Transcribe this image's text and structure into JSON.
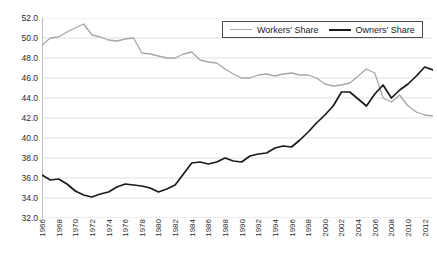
{
  "chart_data": {
    "type": "line",
    "title": "",
    "subtitle": "",
    "xlabel": "",
    "ylabel": "",
    "grid": "horizontal",
    "legend_position": "top-right",
    "ylim": [
      32.0,
      52.0
    ],
    "ytick_step": 2.0,
    "yticks": [
      "52.0",
      "50.0",
      "48.0",
      "46.0",
      "44.0",
      "42.0",
      "40.0",
      "38.0",
      "36.0",
      "34.0",
      "32.0"
    ],
    "xlim": [
      1966,
      2013
    ],
    "xticks": [
      "1966",
      "1968",
      "1970",
      "1972",
      "1974",
      "1976",
      "1978",
      "1980",
      "1982",
      "1984",
      "1986",
      "1988",
      "1990",
      "1992",
      "1994",
      "1996",
      "1998",
      "2000",
      "2002",
      "2004",
      "2006",
      "2008",
      "2010",
      "2012"
    ],
    "x": [
      1966,
      1967,
      1968,
      1969,
      1970,
      1971,
      1972,
      1973,
      1974,
      1975,
      1976,
      1977,
      1978,
      1979,
      1980,
      1981,
      1982,
      1983,
      1984,
      1985,
      1986,
      1987,
      1988,
      1989,
      1990,
      1991,
      1992,
      1993,
      1994,
      1995,
      1996,
      1997,
      1998,
      1999,
      2000,
      2001,
      2002,
      2003,
      2004,
      2005,
      2006,
      2007,
      2008,
      2009,
      2010,
      2011,
      2012,
      2013
    ],
    "series": [
      {
        "name": "Workers' Share",
        "color": "#a6a6a6",
        "width": 1.3,
        "values": [
          49.3,
          50.0,
          50.1,
          50.6,
          51.0,
          51.4,
          50.3,
          50.1,
          49.8,
          49.7,
          49.9,
          50.0,
          48.5,
          48.4,
          48.2,
          48.0,
          48.0,
          48.4,
          48.6,
          47.8,
          47.6,
          47.5,
          46.9,
          46.4,
          46.0,
          46.0,
          46.3,
          46.4,
          46.2,
          46.4,
          46.5,
          46.3,
          46.3,
          46.0,
          45.4,
          45.2,
          45.3,
          45.5,
          46.2,
          46.9,
          46.5,
          44.0,
          43.6,
          44.3,
          43.2,
          42.6,
          42.3,
          42.2
        ]
      },
      {
        "name": "Owners' Share",
        "color": "#1a1a1a",
        "width": 1.7,
        "values": [
          36.3,
          35.8,
          35.9,
          35.4,
          34.7,
          34.3,
          34.1,
          34.4,
          34.6,
          35.1,
          35.4,
          35.3,
          35.2,
          35.0,
          34.6,
          34.9,
          35.3,
          36.4,
          37.5,
          37.6,
          37.4,
          37.6,
          38.0,
          37.7,
          37.6,
          38.2,
          38.4,
          38.5,
          39.0,
          39.2,
          39.1,
          39.8,
          40.6,
          41.5,
          42.3,
          43.2,
          44.6,
          44.6,
          43.9,
          43.2,
          44.4,
          45.3,
          44.0,
          44.8,
          45.4,
          46.2,
          47.1,
          46.8
        ]
      }
    ]
  },
  "legend": {
    "items": [
      {
        "label": "Workers' Share"
      },
      {
        "label": "Owners' Share"
      }
    ]
  }
}
